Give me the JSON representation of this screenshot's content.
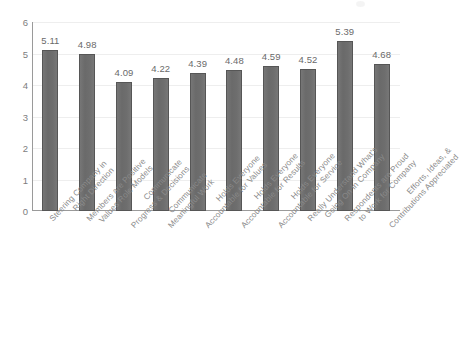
{
  "chart_data": {
    "type": "bar",
    "title": "",
    "subtitle": "",
    "xlabel": "",
    "ylabel": "",
    "ylim": [
      0,
      6
    ],
    "yticks": [
      0,
      1,
      2,
      3,
      4,
      5,
      6
    ],
    "grid": true,
    "legend": false,
    "legend_position": "none",
    "bar_color": "#6c6c6c",
    "label_color": "#8a8a8a",
    "categories": [
      "Steering Company in Right Direction",
      "Members are Positive Values Role Models",
      "Communicate Progress & Decisions",
      "Communicate Meaningful Work",
      "Holds Everyone Accountable for Values",
      "Holds Everyone Accountable for Results",
      "Holds Everyone Accountable for Service",
      "Really Understand What's Going On in Company",
      "Respondents are Proud to Work for Company",
      "Efforts, Ideas, & Contributions Appreciated"
    ],
    "category_lines": [
      [
        "Steering Company in",
        "Right Direction"
      ],
      [
        "Members are Positive",
        "Values Role Models"
      ],
      [
        "Communicate",
        "Progress & Decisions"
      ],
      [
        "Communicate",
        "Meaningful Work"
      ],
      [
        "Holds Everyone",
        "Accountable for Values"
      ],
      [
        "Holds Everyone",
        "Accountable for Results"
      ],
      [
        "Holds Everyone",
        "Accountable for Service"
      ],
      [
        "Really Understand What's",
        "Going On in Company"
      ],
      [
        "Respondents are Proud",
        "to Work for Company"
      ],
      [
        "Efforts, Ideas, &",
        "Contributions Appreciated"
      ]
    ],
    "values": [
      5.11,
      4.98,
      4.09,
      4.22,
      4.39,
      4.48,
      4.59,
      4.52,
      5.39,
      4.68
    ],
    "value_labels": [
      "5.11",
      "4.98",
      "4.09",
      "4.22",
      "4.39",
      "4.48",
      "4.59",
      "4.52",
      "5.39",
      "4.68"
    ],
    "ytick_labels": [
      "0",
      "1",
      "2",
      "3",
      "4",
      "5",
      "6"
    ]
  }
}
